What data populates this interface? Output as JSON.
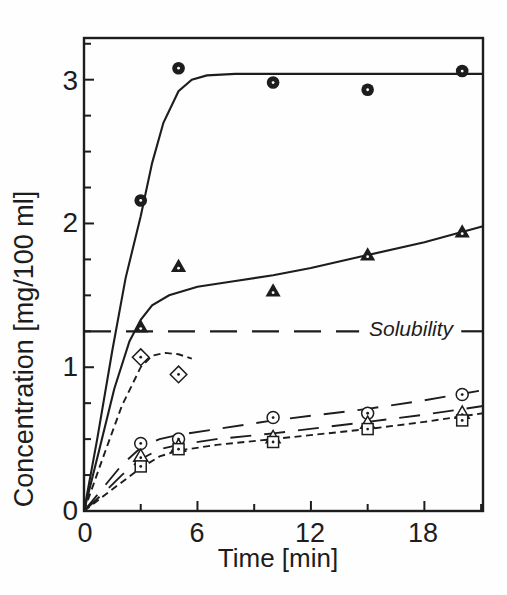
{
  "figure": {
    "background": "#fefefe",
    "ink": "#1d1d1d"
  },
  "chart_data": {
    "type": "scatter",
    "title": "",
    "xlabel": "Time [min]",
    "ylabel": "Concentration [mg/100 ml]",
    "x_tick_labels": [
      "0",
      "6",
      "12",
      "18"
    ],
    "y_tick_labels": [
      "0",
      "1",
      "2",
      "3"
    ],
    "axes": {
      "xlim": [
        0,
        21.1
      ],
      "ylim": [
        0,
        3.29
      ],
      "x_major_ticks": [
        6,
        12,
        18
      ],
      "x_minor_ticks": [
        3,
        9,
        15,
        21
      ],
      "y_major_ticks": [
        1,
        2,
        3
      ],
      "y_minor_ticks": [
        0.25,
        0.5,
        0.75,
        1.25,
        1.5,
        1.75,
        2.25,
        2.5,
        2.75,
        3.25
      ],
      "grid": false,
      "tick_direction": "in",
      "legend": "none"
    },
    "annotation": {
      "text": "Solubility",
      "value": 1.25,
      "line_style": "solubility-dash",
      "segments": [
        [
          0,
          14.55
        ],
        [
          19.95,
          21.1
        ]
      ]
    },
    "series": [
      {
        "name": "filled-circle",
        "marker": "filled-circle-dot",
        "line": "solid",
        "x": [
          3,
          5,
          10,
          15,
          20
        ],
        "y": [
          2.16,
          3.08,
          2.98,
          2.93,
          3.06
        ],
        "curve": [
          [
            0,
            0
          ],
          [
            0.7,
            0.5
          ],
          [
            1.5,
            1.12
          ],
          [
            2.2,
            1.62
          ],
          [
            3,
            2.05
          ],
          [
            3.6,
            2.42
          ],
          [
            4.2,
            2.7
          ],
          [
            5,
            2.92
          ],
          [
            5.7,
            3.0
          ],
          [
            6.5,
            3.03
          ],
          [
            8,
            3.04
          ],
          [
            21.1,
            3.04
          ]
        ]
      },
      {
        "name": "filled-triangle",
        "marker": "filled-triangle-dot",
        "line": "solid",
        "x": [
          3,
          5,
          10,
          15,
          20
        ],
        "y": [
          1.28,
          1.7,
          1.53,
          1.78,
          1.94
        ],
        "curve": [
          [
            0,
            0
          ],
          [
            0.8,
            0.42
          ],
          [
            1.6,
            0.85
          ],
          [
            2.4,
            1.18
          ],
          [
            3,
            1.33
          ],
          [
            3.6,
            1.43
          ],
          [
            4.5,
            1.5
          ],
          [
            6,
            1.56
          ],
          [
            8,
            1.6
          ],
          [
            10,
            1.64
          ],
          [
            12,
            1.69
          ],
          [
            15,
            1.78
          ],
          [
            18,
            1.87
          ],
          [
            21.1,
            1.98
          ]
        ]
      },
      {
        "name": "open-diamond",
        "marker": "open-diamond-dot",
        "line": "short-dash",
        "x": [
          3,
          5
        ],
        "y": [
          1.07,
          0.95
        ],
        "curve": [
          [
            0,
            0
          ],
          [
            1,
            0.37
          ],
          [
            2,
            0.73
          ],
          [
            3,
            1.0
          ],
          [
            3.6,
            1.08
          ],
          [
            4.3,
            1.1
          ],
          [
            5,
            1.09
          ],
          [
            5.7,
            1.06
          ]
        ]
      },
      {
        "name": "open-circle",
        "marker": "open-circle-dot",
        "line": "long-dash",
        "x": [
          3,
          5,
          10,
          15,
          20
        ],
        "y": [
          0.47,
          0.5,
          0.65,
          0.68,
          0.81
        ],
        "curve": [
          [
            0,
            0
          ],
          [
            1,
            0.16
          ],
          [
            2,
            0.32
          ],
          [
            3,
            0.44
          ],
          [
            4,
            0.5
          ],
          [
            5,
            0.53
          ],
          [
            7,
            0.57
          ],
          [
            10,
            0.63
          ],
          [
            15,
            0.71
          ],
          [
            18,
            0.77
          ],
          [
            21.1,
            0.84
          ]
        ]
      },
      {
        "name": "open-triangle",
        "marker": "open-triangle-dot",
        "line": "long-dash",
        "x": [
          3,
          5,
          10,
          15,
          20
        ],
        "y": [
          0.38,
          0.45,
          0.51,
          0.61,
          0.68
        ],
        "curve": [
          [
            0,
            0
          ],
          [
            1,
            0.12
          ],
          [
            2,
            0.25
          ],
          [
            3,
            0.36
          ],
          [
            4,
            0.43
          ],
          [
            5,
            0.46
          ],
          [
            7,
            0.5
          ],
          [
            10,
            0.54
          ],
          [
            15,
            0.62
          ],
          [
            18,
            0.67
          ],
          [
            21.1,
            0.73
          ]
        ]
      },
      {
        "name": "open-square",
        "marker": "open-square-dot",
        "line": "short-dash",
        "x": [
          3,
          5,
          10,
          15,
          20
        ],
        "y": [
          0.31,
          0.43,
          0.48,
          0.57,
          0.63
        ],
        "curve": [
          [
            0,
            0
          ],
          [
            1,
            0.1
          ],
          [
            2,
            0.2
          ],
          [
            3,
            0.3
          ],
          [
            4,
            0.38
          ],
          [
            5,
            0.42
          ],
          [
            7,
            0.46
          ],
          [
            10,
            0.5
          ],
          [
            15,
            0.57
          ],
          [
            18,
            0.62
          ],
          [
            21.1,
            0.68
          ]
        ]
      }
    ]
  }
}
